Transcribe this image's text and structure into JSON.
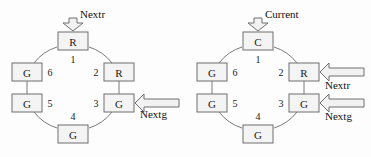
{
  "figure": {
    "background_color": "#fdfdfd",
    "stroke_color": "#6e6e6e",
    "box_fill": "#f4f4f4",
    "text_color": "#1a1a1a"
  },
  "diagrams": [
    {
      "id": "left",
      "name": "ring-diagram-left",
      "nodes": [
        {
          "index": "1",
          "letter": "R",
          "position": "top",
          "cx": 73,
          "cy": 41,
          "label_dx": 0,
          "label_dy": 18,
          "label_anchor": "middle"
        },
        {
          "index": "2",
          "letter": "R",
          "position": "upper-right",
          "cx": 119,
          "cy": 72,
          "label_dx": -23,
          "label_dy": 0,
          "label_anchor": "middle"
        },
        {
          "index": "3",
          "letter": "G",
          "position": "lower-right",
          "cx": 119,
          "cy": 103,
          "label_dx": -23,
          "label_dy": 0,
          "label_anchor": "middle"
        },
        {
          "index": "4",
          "letter": "G",
          "position": "bottom",
          "cx": 73,
          "cy": 134,
          "label_dx": 0,
          "label_dy": -18,
          "label_anchor": "middle"
        },
        {
          "index": "5",
          "letter": "G",
          "position": "lower-left",
          "cx": 27,
          "cy": 103,
          "label_dx": 23,
          "label_dy": 0,
          "label_anchor": "middle"
        },
        {
          "index": "6",
          "letter": "G",
          "position": "upper-left",
          "cx": 27,
          "cy": 72,
          "label_dx": 23,
          "label_dy": 0,
          "label_anchor": "middle"
        }
      ],
      "input_arrows": [
        {
          "label": "Nextr",
          "direction": "down",
          "target_index": "1",
          "label_x": 80,
          "label_y": 14
        },
        {
          "label": "Nextg",
          "direction": "left",
          "target_index": "3",
          "label_x": 140,
          "label_y": 114
        }
      ]
    },
    {
      "id": "right",
      "name": "ring-diagram-right",
      "nodes": [
        {
          "index": "1",
          "letter": "C",
          "position": "top",
          "cx": 73,
          "cy": 41,
          "label_dx": 0,
          "label_dy": 18,
          "label_anchor": "middle"
        },
        {
          "index": "2",
          "letter": "R",
          "position": "upper-right",
          "cx": 119,
          "cy": 72,
          "label_dx": -23,
          "label_dy": 0,
          "label_anchor": "middle"
        },
        {
          "index": "3",
          "letter": "G",
          "position": "lower-right",
          "cx": 119,
          "cy": 103,
          "label_dx": -23,
          "label_dy": 0,
          "label_anchor": "middle"
        },
        {
          "index": "4",
          "letter": "G",
          "position": "bottom",
          "cx": 73,
          "cy": 134,
          "label_dx": 0,
          "label_dy": -18,
          "label_anchor": "middle"
        },
        {
          "index": "5",
          "letter": "G",
          "position": "lower-left",
          "cx": 27,
          "cy": 103,
          "label_dx": 23,
          "label_dy": 0,
          "label_anchor": "middle"
        },
        {
          "index": "6",
          "letter": "G",
          "position": "upper-left",
          "cx": 27,
          "cy": 72,
          "label_dx": 23,
          "label_dy": 0,
          "label_anchor": "middle"
        }
      ],
      "input_arrows": [
        {
          "label": "Current",
          "direction": "down",
          "target_index": "1",
          "label_x": 80,
          "label_y": 14
        },
        {
          "label": "Nextr",
          "direction": "left",
          "target_index": "2",
          "label_x": 140,
          "label_y": 85
        },
        {
          "label": "Nextg",
          "direction": "left",
          "target_index": "3",
          "label_x": 140,
          "label_y": 116
        }
      ]
    }
  ]
}
